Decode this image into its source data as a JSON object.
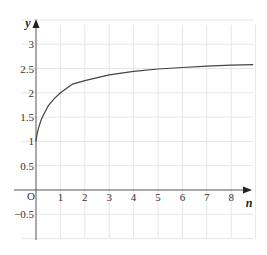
{
  "chart_data": {
    "type": "line",
    "title": "",
    "xlabel": "n",
    "ylabel": "y",
    "origin_label": "O",
    "xlim": [
      -0.9,
      8.9
    ],
    "ylim": [
      -1.0,
      3.5
    ],
    "x_ticks": [
      1,
      2,
      3,
      4,
      5,
      6,
      7,
      8
    ],
    "y_ticks": [
      -0.5,
      0.5,
      1,
      1.5,
      2,
      2.5,
      3
    ],
    "x_tick_labels": [
      "1",
      "2",
      "3",
      "4",
      "5",
      "6",
      "7",
      "8"
    ],
    "y_tick_labels": [
      "−0.5",
      "0.5",
      "1",
      "1.5",
      "2",
      "2.5",
      "3"
    ],
    "grid": true,
    "legend": null,
    "series": [
      {
        "name": "y = (1 + 1/n)^n",
        "x": [
          0.01,
          0.05,
          0.1,
          0.2,
          0.3,
          0.5,
          0.75,
          1,
          1.5,
          2,
          3,
          4,
          5,
          6,
          7,
          8,
          8.9
        ],
        "values": [
          1.05,
          1.16,
          1.27,
          1.43,
          1.54,
          1.73,
          1.88,
          2.0,
          2.18,
          2.25,
          2.37,
          2.44,
          2.49,
          2.52,
          2.55,
          2.57,
          2.58
        ]
      }
    ],
    "colors": {
      "curve": "#444444",
      "axes": "#555555",
      "grid": "#e6e6e6"
    }
  }
}
